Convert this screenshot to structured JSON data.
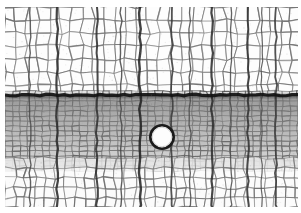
{
  "figure": {
    "kind": "light-micrograph",
    "caption": "",
    "width": 301,
    "height": 213,
    "background_color": "#ffffff",
    "margins": {
      "top": 7,
      "right": 3,
      "bottom": 6,
      "left": 5
    }
  },
  "palette": {
    "paper": "#ffffff",
    "cell_wall_light": "#9a9a9a",
    "cell_wall_dark": "#2b2b2b",
    "lumen_earlywood": "#fbfbfb",
    "lumen_latewood": "#d6d6d6",
    "latewood_tone": "#8d8d8d",
    "ring_boundary": "#1a1a1a",
    "ray_line": "#333333",
    "pore_fill": "#fdfdfd",
    "pore_outline": "#1d1d1d"
  },
  "structure": {
    "zones": [
      {
        "name": "earlywood-upper",
        "label": "Earlywood (large thin-walled cells)",
        "y_top": 7,
        "y_bottom": 94,
        "tone": "#ffffff",
        "cell_width": 11,
        "cell_height": 13,
        "wall_color": "#6f6f6f",
        "wall_width": 1.0,
        "jitter": 2.4,
        "lumen": "#fdfdfd"
      },
      {
        "name": "latewood-dense",
        "label": "Latewood / dense radial files",
        "y_top": 96,
        "y_bottom": 168,
        "tone": "#8f8f8f",
        "cell_width": 7.5,
        "cell_height": 5.0,
        "wall_color": "#4a4a4a",
        "wall_width": 0.85,
        "jitter": 0.9,
        "lumen": "#dcdcdc"
      },
      {
        "name": "earlywood-lower",
        "label": "Earlywood of next increment",
        "y_top": 168,
        "y_bottom": 207,
        "tone": "#ffffff",
        "cell_width": 10,
        "cell_height": 10,
        "wall_color": "#6a6a6a",
        "wall_width": 1.0,
        "jitter": 2.0,
        "lumen": "#fbfbfb"
      }
    ],
    "ring_boundary": {
      "name": "growth-ring-boundary",
      "y": 95,
      "thickness": 3.2,
      "color": "#141414"
    },
    "rays": [
      {
        "x": 57,
        "width": 2.2,
        "color": "#2a2a2a"
      },
      {
        "x": 97,
        "width": 2.0,
        "color": "#303030"
      },
      {
        "x": 140,
        "width": 2.4,
        "color": "#262626"
      },
      {
        "x": 172,
        "width": 1.8,
        "color": "#3a3a3a"
      },
      {
        "x": 212,
        "width": 2.2,
        "color": "#2c2c2c"
      },
      {
        "x": 248,
        "width": 2.0,
        "color": "#323232"
      },
      {
        "x": 276,
        "width": 1.8,
        "color": "#3a3a3a"
      },
      {
        "x": 30,
        "width": 1.4,
        "color": "#4a4a4a"
      },
      {
        "x": 121,
        "width": 1.4,
        "color": "#484848"
      },
      {
        "x": 190,
        "width": 1.3,
        "color": "#4c4c4c"
      },
      {
        "x": 231,
        "width": 1.3,
        "color": "#4c4c4c"
      },
      {
        "x": 262,
        "width": 1.2,
        "color": "#505050"
      }
    ],
    "pore": {
      "name": "vessel-pore",
      "label": "Large solitary vessel / resin canal",
      "cx": 162,
      "cy": 137,
      "r": 10.5,
      "outline_width": 2.6,
      "fill": "#fdfdfd",
      "outline": "#1b1b1b"
    },
    "shading_bands": [
      {
        "y": 96,
        "h": 14,
        "opacity": 0.3
      },
      {
        "y": 110,
        "h": 18,
        "opacity": 0.24
      },
      {
        "y": 128,
        "h": 20,
        "opacity": 0.2
      },
      {
        "y": 148,
        "h": 20,
        "opacity": 0.12
      }
    ]
  },
  "render": {
    "noise_seed": 20240917,
    "grain_opacity": 0.07
  }
}
